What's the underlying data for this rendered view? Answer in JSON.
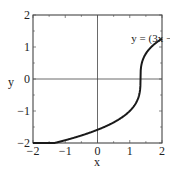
{
  "chart_data": {
    "type": "line",
    "title": "",
    "xlabel": "x",
    "ylabel": "y",
    "xlim": [
      -2,
      2
    ],
    "ylim": [
      -2,
      2
    ],
    "grid": false,
    "x_ticks": [
      -2,
      -1,
      0,
      1,
      2
    ],
    "y_ticks": [
      -2,
      -1,
      0,
      1,
      2
    ],
    "x_tick_labels": [
      "−2",
      "−1",
      "0",
      "1",
      "2"
    ],
    "y_tick_labels": [
      "−2",
      "−1",
      "0",
      "1",
      "2"
    ],
    "annotation": {
      "text_main": "y = (3x − 4)",
      "text_sup": "1/3",
      "x": 1.05,
      "y": 1.15
    },
    "series": [
      {
        "name": "y = (3x - 4)^(1/3)",
        "function": "cbrt(3x-4)",
        "color": "#1a1a1a",
        "x": [
          -2,
          -1.5,
          -1,
          -0.5,
          0,
          0.5,
          1,
          1.2,
          1.3,
          1.333,
          1.36,
          1.45,
          1.6,
          1.8,
          2
        ],
        "y": [
          -2.154,
          -2.041,
          -1.913,
          -1.765,
          -1.587,
          -1.357,
          -1.0,
          -0.737,
          -0.464,
          0.0,
          0.431,
          0.705,
          0.928,
          1.091,
          1.26
        ]
      }
    ]
  }
}
